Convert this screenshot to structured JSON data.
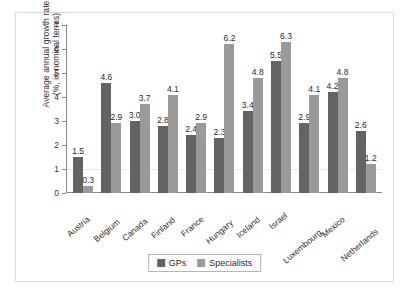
{
  "chart_data": {
    "type": "bar",
    "title": "",
    "xlabel": "",
    "ylabel_line1": "Average annual growth rate",
    "ylabel_line2": "(%, in nominal terms)",
    "ylim": [
      0,
      7
    ],
    "yticks": [
      0,
      1,
      2,
      3,
      4,
      5,
      6,
      7
    ],
    "grid": "horizontal-faint",
    "legend_position": "bottom-center",
    "categories": [
      "Austria",
      "Belgium",
      "Canada",
      "Finland",
      "France",
      "Hungary",
      "Iceland",
      "Israel",
      "Luxembourg",
      "Mexico",
      "Netherlands"
    ],
    "series": [
      {
        "name": "GPs",
        "color": "#636363",
        "values": [
          1.5,
          4.6,
          3.0,
          2.8,
          2.4,
          2.3,
          3.4,
          5.5,
          2.9,
          4.2,
          2.6
        ],
        "labels": [
          "1.5",
          "4.6",
          "3.0",
          "2.8",
          "2.4",
          "2.3",
          "3.4",
          "5.5",
          "2.9",
          "4.2",
          "2.6"
        ]
      },
      {
        "name": "Specialists",
        "color": "#9a9a9a",
        "values": [
          0.3,
          2.9,
          3.7,
          4.1,
          2.9,
          6.2,
          4.8,
          6.3,
          4.1,
          4.8,
          1.2
        ],
        "labels": [
          "0.3",
          "2.9",
          "3.7",
          "4.1",
          "2.9",
          "6.2",
          "4.8",
          "6.3",
          "4.1",
          "4.8",
          "1.2"
        ]
      }
    ]
  }
}
